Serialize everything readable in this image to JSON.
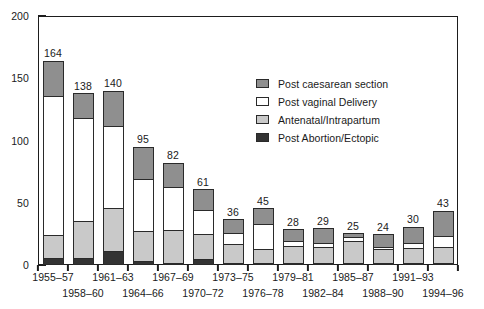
{
  "chart_data": {
    "type": "bar",
    "subtype": "stacked-column",
    "title": "",
    "xlabel": "",
    "ylabel": "",
    "ylim": [
      0,
      200
    ],
    "y_major_ticks": [
      0,
      50,
      100,
      150,
      200
    ],
    "y_minor_tick_interval": 10,
    "grid": false,
    "legend_position": "inside-upper-right",
    "categories": [
      "1955–57",
      "1958–60",
      "1961–63",
      "1964–66",
      "1967–69",
      "1970–72",
      "1973–75",
      "1976–78",
      "1979–81",
      "1982–84",
      "1985–87",
      "1988–90",
      "1991–93",
      "1994–96"
    ],
    "series": [
      {
        "name": "Post caesarean section",
        "color": "#8f8f8f",
        "values": [
          28,
          20,
          28,
          26,
          19,
          17,
          11,
          13,
          9,
          12,
          3,
          10,
          13,
          20
        ]
      },
      {
        "name": "Post vaginal Delivery",
        "color": "#ffffff",
        "values": [
          112,
          83,
          66,
          42,
          35,
          19,
          9,
          20,
          4,
          3,
          3,
          2,
          4,
          9
        ]
      },
      {
        "name": "Antenatal/Intrapartum",
        "color": "#c9c9c9",
        "values": [
          18,
          29,
          35,
          24,
          26,
          20,
          15,
          11,
          14,
          13,
          18,
          11,
          12,
          13
        ]
      },
      {
        "name": "Post Abortion/Ectopic",
        "color": "#333333",
        "values": [
          6,
          6,
          11,
          3,
          2,
          5,
          1,
          1,
          1,
          1,
          1,
          1,
          1,
          1
        ]
      }
    ],
    "totals": [
      164,
      138,
      140,
      95,
      82,
      61,
      36,
      45,
      28,
      29,
      25,
      24,
      30,
      43
    ],
    "total_labels": [
      "164",
      "138",
      "140",
      "95",
      "82",
      "61",
      "36",
      "45",
      "28",
      "29",
      "25",
      "24",
      "30",
      "43"
    ]
  },
  "axis": {
    "y_labels": [
      "200",
      "150",
      "100",
      "50",
      "0"
    ],
    "y_values": [
      200,
      150,
      100,
      50,
      0
    ]
  },
  "legend": {
    "items": [
      {
        "label": "Post caesarean section",
        "color": "#8f8f8f"
      },
      {
        "label": "Post vaginal Delivery",
        "color": "#ffffff"
      },
      {
        "label": "Antenatal/Intrapartum",
        "color": "#c9c9c9"
      },
      {
        "label": "Post Abortion/Ectopic",
        "color": "#333333"
      }
    ]
  },
  "caption": {
    "text": ""
  }
}
